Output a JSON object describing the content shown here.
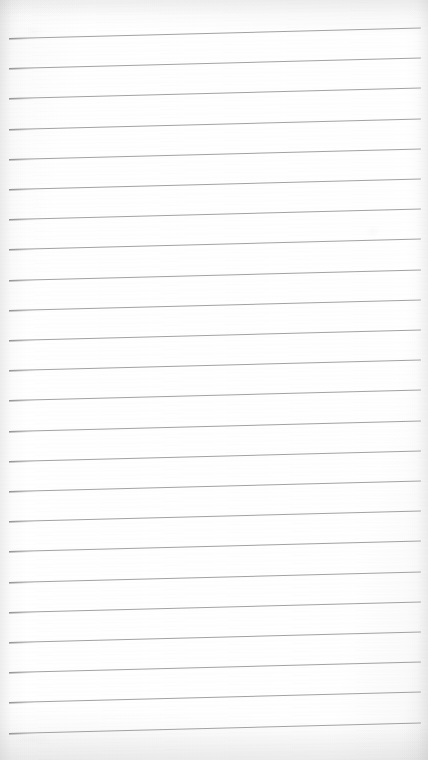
{
  "document": {
    "kind": "lined-paper-sheet",
    "title": "Blank Ruled Paper",
    "page_width_px": 428,
    "page_height_px": 760,
    "background_color": "#fdfdfd",
    "paper_tone_color": "#ffffff",
    "is_blank": true,
    "written_content": "",
    "handwriting_present": "none",
    "text_lines": []
  },
  "ruling": {
    "style": "horizontal-ruled",
    "line_color": "#9a9a9a",
    "line_thickness_px": 1,
    "line_count": 24,
    "line_spacing_px": 30.2,
    "first_line_y_px": 33,
    "last_line_y_px": 727,
    "line_start_x_px": 9,
    "line_end_x_px": 421,
    "line_length_px": 412,
    "skew_degrees": -1.45,
    "skew_note": "lines rise toward the right edge of the scan",
    "margin_rule_present": "none",
    "left_margin_px": 9,
    "right_margin_px": 7,
    "top_margin_px": 33,
    "bottom_margin_px": 33,
    "line_y_left": [
      38.0,
      68.2,
      98.4,
      128.6,
      158.8,
      189.0,
      219.2,
      249.4,
      279.6,
      309.8,
      340.0,
      370.2,
      400.4,
      430.6,
      460.8,
      491.0,
      521.2,
      551.4,
      581.6,
      611.8,
      642.0,
      672.2,
      702.4,
      732.6
    ]
  },
  "artifacts": {
    "scan_vignette": true,
    "edge_shadow_color": "#aaaaaa",
    "grain_noise": "faint",
    "smudges": [
      {
        "name": "faint-smudge-upper-right",
        "x": 368,
        "y": 228,
        "w": 10,
        "h": 7,
        "opacity": 0.05
      },
      {
        "name": "faint-smudge-upper-left",
        "x": 26,
        "y": 28,
        "w": 14,
        "h": 8,
        "opacity": 0.04
      },
      {
        "name": "faint-smudge-lower-left",
        "x": 18,
        "y": 736,
        "w": 30,
        "h": 6,
        "opacity": 0.05
      }
    ]
  }
}
